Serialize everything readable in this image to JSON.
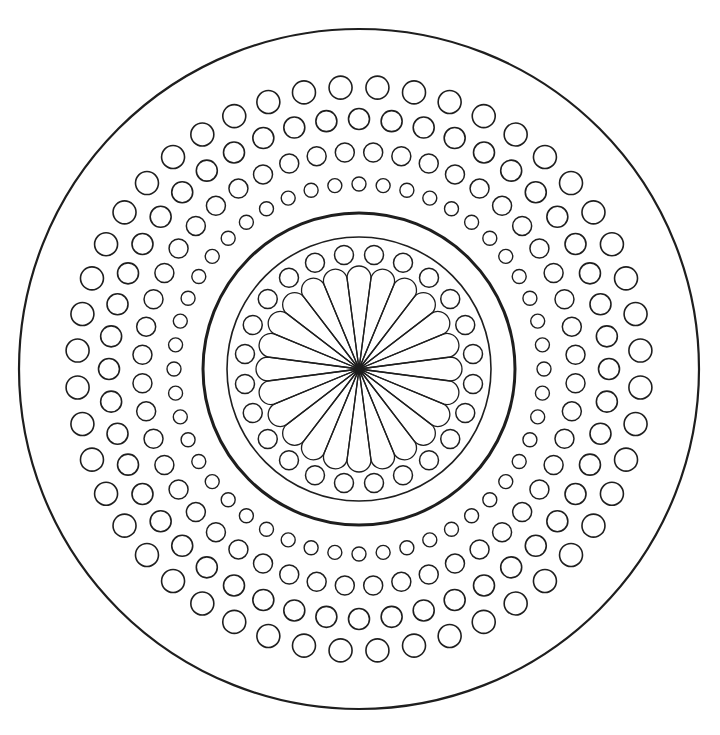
{
  "canvas": {
    "width": 720,
    "height": 735,
    "background": "#ffffff"
  },
  "stroke_color": "#1e1e1e",
  "center": {
    "x": 359,
    "y": 369
  },
  "outer_circle": {
    "r": 340,
    "stroke_width": 2.2
  },
  "dot_rings": [
    {
      "name": "ring-1-outer",
      "r": 282,
      "count": 48,
      "dot_r": 11.5,
      "offset": 0.5,
      "stroke_width": 1.6
    },
    {
      "name": "ring-2",
      "r": 250,
      "count": 48,
      "dot_r": 10.5,
      "offset": 0,
      "stroke_width": 1.6
    },
    {
      "name": "ring-3",
      "r": 217,
      "count": 48,
      "dot_r": 9.5,
      "offset": 0.5,
      "stroke_width": 1.5
    },
    {
      "name": "ring-4-inner",
      "r": 185,
      "count": 48,
      "dot_r": 7.0,
      "offset": 0,
      "stroke_width": 1.4
    }
  ],
  "thick_circle": {
    "r": 156,
    "stroke_width": 3
  },
  "thin_circle": {
    "r": 132,
    "stroke_width": 1.6
  },
  "inner_dot_ring": {
    "r": 115,
    "count": 24,
    "dot_r": 9.5,
    "offset": 0.5,
    "stroke_width": 1.5
  },
  "flower": {
    "petal_count": 24,
    "petal_length": 103,
    "petal_half_width": 12,
    "offset": 0,
    "stroke_width": 1.3
  }
}
